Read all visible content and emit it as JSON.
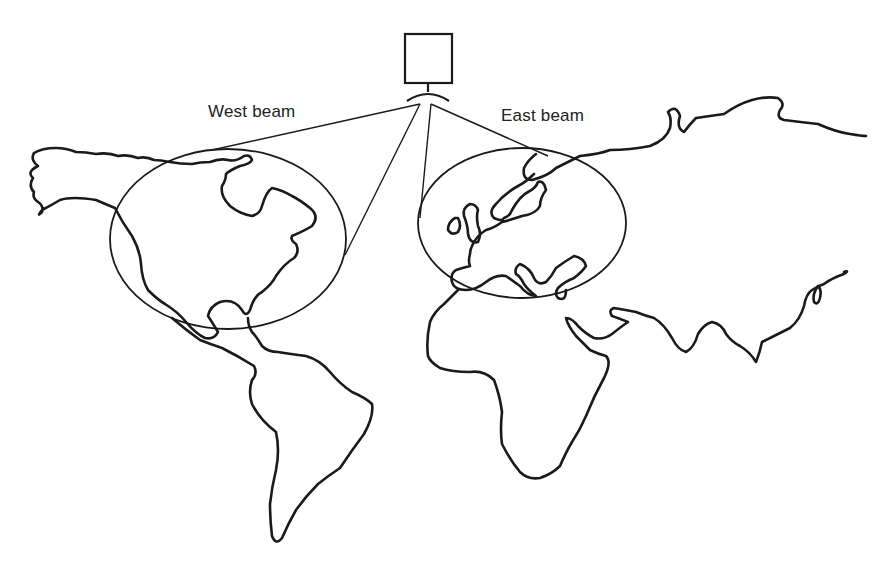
{
  "diagram": {
    "type": "satellite beam coverage map",
    "satellite": {
      "icon": "satellite-icon"
    },
    "beams": [
      {
        "id": "west",
        "label": "West beam",
        "covers": "North America"
      },
      {
        "id": "east",
        "label": "East beam",
        "covers": "Europe"
      }
    ],
    "map": {
      "regions": [
        "North America",
        "South America",
        "Europe",
        "Africa",
        "Asia"
      ]
    },
    "colors": {
      "line": "#1a1a1a",
      "background": "#ffffff",
      "text": "#222222"
    }
  }
}
